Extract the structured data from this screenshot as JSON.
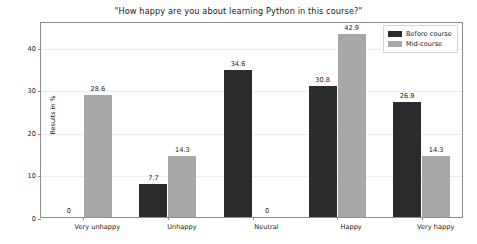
{
  "chart_data": {
    "type": "bar",
    "title": "\"How happy are you about learning Python in this course?\"",
    "xlabel": "",
    "ylabel": "Results in %",
    "categories": [
      "Very unhappy",
      "Unhappy",
      "Neutral",
      "Happy",
      "Very happy"
    ],
    "series": [
      {
        "name": "Before course",
        "color": "#2b2b2b",
        "values": [
          0,
          7.7,
          34.6,
          30.8,
          26.9
        ],
        "labels": [
          "0",
          "7.7",
          "34.6",
          "30.8",
          "26.9"
        ]
      },
      {
        "name": "Mid-course",
        "color": "#a8a8a8",
        "values": [
          28.6,
          14.3,
          0,
          42.9,
          14.3
        ],
        "labels": [
          "28.6",
          "14.3",
          "0",
          "42.9",
          "14.3"
        ]
      }
    ],
    "ylim": [
      0,
      46
    ],
    "yticks": [
      0,
      10,
      20,
      30,
      40
    ],
    "ytick_labels": [
      "0",
      "10",
      "20",
      "30",
      "40"
    ],
    "grid": true,
    "legend_position": "upper right"
  }
}
